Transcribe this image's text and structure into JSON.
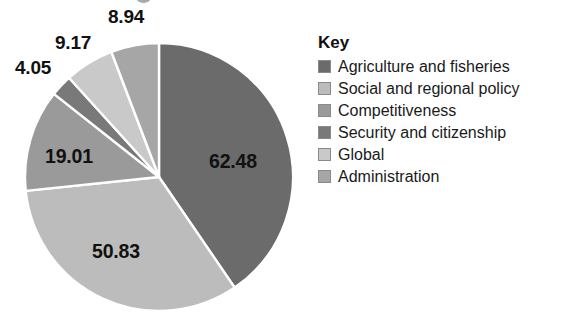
{
  "chart_data": {
    "type": "pie",
    "title": "",
    "categories": [
      "Agriculture and fisheries",
      "Social and regional policy",
      "Competitiveness",
      "Security and citizenship",
      "Global",
      "Administration"
    ],
    "values": [
      62.48,
      50.83,
      19.01,
      4.05,
      9.17,
      8.94
    ],
    "value_labels": [
      "62.48",
      "50.83",
      "19.01",
      "4.05",
      "9.17",
      "8.94"
    ],
    "total": 154.48,
    "colors": [
      "#6b6b6b",
      "#bcbcbc",
      "#9a9a9a",
      "#797979",
      "#c9c9c9",
      "#a6a6a6"
    ],
    "start_angle_deg": 0,
    "direction": "clockwise",
    "legend_position": "right",
    "grid": false,
    "xlabel": "",
    "ylabel": ""
  },
  "legend": {
    "title": "Key",
    "items": [
      {
        "label": "Agriculture and fisheries",
        "color": "#6b6b6b"
      },
      {
        "label": "Social and regional policy",
        "color": "#bcbcbc"
      },
      {
        "label": "Competitiveness",
        "color": "#9a9a9a"
      },
      {
        "label": "Security and citizenship",
        "color": "#797979"
      },
      {
        "label": "Global",
        "color": "#c9c9c9"
      },
      {
        "label": "Administration",
        "color": "#a6a6a6"
      }
    ]
  },
  "pie_labels": [
    {
      "text": "62.48",
      "x": 209,
      "y": 150,
      "placement": "inside"
    },
    {
      "text": "50.83",
      "x": 92,
      "y": 240,
      "placement": "inside"
    },
    {
      "text": "19.01",
      "x": 45,
      "y": 145,
      "placement": "inside"
    },
    {
      "text": "4.05",
      "x": 15,
      "y": 57,
      "placement": "outside"
    },
    {
      "text": "9.17",
      "x": 55,
      "y": 32,
      "placement": "outside"
    },
    {
      "text": "8.94",
      "x": 108,
      "y": 6,
      "placement": "outside"
    }
  ]
}
